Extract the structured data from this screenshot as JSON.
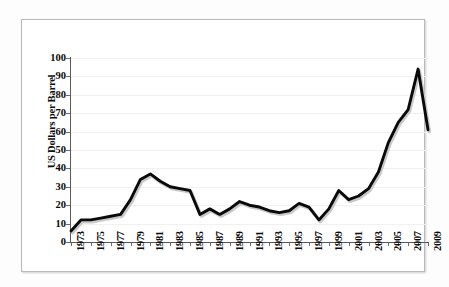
{
  "figure": {
    "y_axis_title": "US Dollars per Barrel",
    "line_color": "#0a0a0a",
    "shadow_color": "#c9c9c9",
    "grid_color": "#f1f1f1",
    "axis_color": "#5a5a5a",
    "background": "#ffffff"
  },
  "chart_data": {
    "type": "line",
    "title": "",
    "xlabel": "",
    "ylabel": "US Dollars per Barrel",
    "xlim": [
      1973,
      2009
    ],
    "ylim": [
      0,
      100
    ],
    "yticks": [
      0,
      10,
      20,
      30,
      40,
      50,
      60,
      70,
      80,
      90,
      100
    ],
    "ytick_labels": [
      "0",
      "10",
      "20",
      "30",
      "40",
      "50",
      "60",
      "70",
      "80",
      "90",
      "100"
    ],
    "xticks": [
      1973,
      1975,
      1977,
      1979,
      1981,
      1983,
      1985,
      1987,
      1989,
      1991,
      1993,
      1995,
      1997,
      1999,
      2001,
      2003,
      2005,
      2007,
      2009
    ],
    "xtick_labels": [
      "1973",
      "1975",
      "1977",
      "1979",
      "1981",
      "1983",
      "1985",
      "1987",
      "1989",
      "1991",
      "1993",
      "1995",
      "1997",
      "1999",
      "2001",
      "2003",
      "2005",
      "2007",
      "2009"
    ],
    "grid": true,
    "grid_axis": "y",
    "legend": false,
    "x": [
      1973,
      1974,
      1975,
      1976,
      1977,
      1978,
      1979,
      1980,
      1981,
      1982,
      1983,
      1984,
      1985,
      1986,
      1987,
      1988,
      1989,
      1990,
      1991,
      1992,
      1993,
      1994,
      1995,
      1996,
      1997,
      1998,
      1999,
      2000,
      2001,
      2002,
      2003,
      2004,
      2005,
      2006,
      2007,
      2008,
      2009
    ],
    "values": [
      6,
      12,
      12,
      13,
      14,
      15,
      23,
      34,
      37,
      33,
      30,
      29,
      28,
      15,
      18,
      15,
      18,
      22,
      20,
      19,
      17,
      16,
      17,
      21,
      19,
      12,
      18,
      28,
      23,
      25,
      29,
      38,
      54,
      65,
      72,
      94,
      61
    ],
    "series": [
      {
        "name": "Crude oil price",
        "values": [
          6,
          12,
          12,
          13,
          14,
          15,
          23,
          34,
          37,
          33,
          30,
          29,
          28,
          15,
          18,
          15,
          18,
          22,
          20,
          19,
          17,
          16,
          17,
          21,
          19,
          12,
          18,
          28,
          23,
          25,
          29,
          38,
          54,
          65,
          72,
          94,
          61
        ]
      }
    ]
  }
}
